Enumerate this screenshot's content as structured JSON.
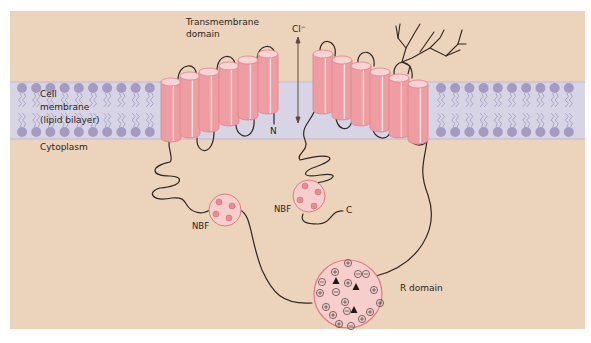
{
  "labels": {
    "transmembrane_line1": "Transmembrane",
    "transmembrane_line2": "domain",
    "chloride": "Cl",
    "chloride_sup": "−",
    "membrane_line1": "Cell",
    "membrane_line2": "membrane",
    "membrane_line3": "(lipid bilayer)",
    "cytoplasm": "Cytoplasm",
    "n_terminus": "N",
    "c_terminus": "C",
    "nbf_left": "NBF",
    "nbf_right": "NBF",
    "r_domain": "R domain"
  },
  "r_domain_contents": {
    "plus_count": 12,
    "minus_count": 6,
    "triangle_count": 3
  },
  "colors": {
    "background": "#ecd3bb",
    "membrane": "#d7d4e6",
    "lipid_head": "#a59ac2",
    "helix_fill": "#ee9ea2",
    "helix_top": "#f7d3d3",
    "domain_fill": "#f6cfcd",
    "domain_stroke": "#e07a80",
    "chain": "#2f2721"
  }
}
